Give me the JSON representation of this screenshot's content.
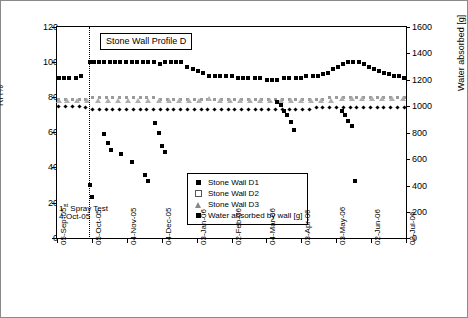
{
  "chart_data": {
    "type": "scatter",
    "title": "Stone Wall Profile D",
    "xlabel": "",
    "ylabel_left": "RH%",
    "ylabel_right": "Water absorbed [g]",
    "ylim_left": [
      0,
      120
    ],
    "ylim_right": [
      0,
      1600
    ],
    "yticks_left": [
      0,
      20,
      40,
      60,
      80,
      100,
      120
    ],
    "yticks_right": [
      0,
      200,
      400,
      600,
      800,
      1000,
      1200,
      1400,
      1600
    ],
    "grid": false,
    "legend_position": "inside-bottom-center",
    "annotations": [
      {
        "text_line1": "1st Spray Test",
        "text_line2": "4-Oct-05"
      }
    ],
    "xticks": [
      "05-Sep-05",
      "05-Oct-05",
      "04-Nov-05",
      "04-Dec-05",
      "03-Jan-06",
      "02-Feb-06",
      "04-Mar-06",
      "03-Apr-06",
      "03-May-06",
      "02-Jun-06",
      "02-Jul-06"
    ],
    "series": [
      {
        "name": "Stone Wall D1",
        "axis": "left",
        "marker": "filled-square",
        "points": [
          [
            0.5,
            91
          ],
          [
            2.0,
            91
          ],
          [
            3.5,
            91
          ],
          [
            5.5,
            91
          ],
          [
            7.0,
            92
          ],
          [
            9.6,
            100
          ],
          [
            11.0,
            100
          ],
          [
            12.5,
            100
          ],
          [
            14.0,
            100
          ],
          [
            15.5,
            100
          ],
          [
            17.0,
            100
          ],
          [
            18.5,
            100
          ],
          [
            20.5,
            100
          ],
          [
            22.0,
            100
          ],
          [
            23.5,
            100
          ],
          [
            25.5,
            100
          ],
          [
            27.0,
            100
          ],
          [
            28.5,
            100
          ],
          [
            30.5,
            99
          ],
          [
            32.0,
            100
          ],
          [
            33.5,
            100
          ],
          [
            35.0,
            100
          ],
          [
            36.5,
            100
          ],
          [
            38.5,
            97
          ],
          [
            40.0,
            96
          ],
          [
            41.5,
            95
          ],
          [
            43.0,
            94
          ],
          [
            45.0,
            92
          ],
          [
            46.5,
            92
          ],
          [
            48.0,
            92
          ],
          [
            50.0,
            92
          ],
          [
            51.5,
            92
          ],
          [
            53.5,
            91
          ],
          [
            55.0,
            91
          ],
          [
            56.5,
            91
          ],
          [
            58.5,
            91
          ],
          [
            60.0,
            91
          ],
          [
            62.0,
            90
          ],
          [
            63.5,
            90
          ],
          [
            65.0,
            90
          ],
          [
            67.0,
            91
          ],
          [
            68.5,
            91
          ],
          [
            70.5,
            91
          ],
          [
            72.0,
            91
          ],
          [
            73.5,
            92
          ],
          [
            75.5,
            92
          ],
          [
            77.0,
            92
          ],
          [
            78.5,
            93
          ],
          [
            80.0,
            94
          ],
          [
            81.5,
            96
          ],
          [
            83.0,
            97
          ],
          [
            84.5,
            99
          ],
          [
            86.0,
            100
          ],
          [
            87.5,
            100
          ],
          [
            89.0,
            100
          ],
          [
            90.5,
            99
          ],
          [
            92.0,
            97
          ],
          [
            93.5,
            96
          ],
          [
            95.0,
            95
          ],
          [
            96.5,
            94
          ],
          [
            98.0,
            93
          ],
          [
            99.5,
            92
          ],
          [
            101.0,
            92
          ],
          [
            102.5,
            91
          ]
        ]
      },
      {
        "name": "Stone Wall D2",
        "axis": "left",
        "marker": "open-square",
        "points": [
          [
            0.5,
            79
          ],
          [
            2.5,
            79
          ],
          [
            4.5,
            79
          ],
          [
            6.5,
            79
          ],
          [
            8.5,
            79
          ],
          [
            10.5,
            80
          ],
          [
            12.5,
            80
          ],
          [
            14.5,
            80
          ],
          [
            16.5,
            80
          ],
          [
            18.5,
            80
          ],
          [
            20.5,
            80
          ],
          [
            22.5,
            80
          ],
          [
            24.5,
            80
          ],
          [
            26.5,
            80
          ],
          [
            28.5,
            80
          ],
          [
            30.5,
            79
          ],
          [
            32.5,
            79
          ],
          [
            34.5,
            79
          ],
          [
            36.5,
            79
          ],
          [
            38.5,
            79
          ],
          [
            40.5,
            79
          ],
          [
            42.5,
            79
          ],
          [
            44.5,
            79
          ],
          [
            46.5,
            79
          ],
          [
            48.5,
            79
          ],
          [
            50.5,
            79
          ],
          [
            52.5,
            79
          ],
          [
            54.5,
            79
          ],
          [
            56.5,
            79
          ],
          [
            58.5,
            79
          ],
          [
            60.5,
            79
          ],
          [
            62.5,
            79
          ],
          [
            64.5,
            79
          ],
          [
            66.5,
            79
          ],
          [
            68.5,
            79
          ],
          [
            70.5,
            79
          ],
          [
            72.5,
            79
          ],
          [
            74.5,
            79
          ],
          [
            76.5,
            79
          ],
          [
            78.5,
            79
          ],
          [
            80.5,
            80
          ],
          [
            82.5,
            80
          ],
          [
            84.5,
            80
          ],
          [
            86.5,
            80
          ],
          [
            88.5,
            80
          ],
          [
            90.5,
            80
          ],
          [
            92.5,
            80
          ],
          [
            94.5,
            80
          ],
          [
            96.5,
            80
          ],
          [
            98.5,
            80
          ],
          [
            100.5,
            80
          ],
          [
            102.5,
            80
          ]
        ]
      },
      {
        "name": "Stone Wall D3",
        "axis": "left",
        "marker": "triangle",
        "points": [
          [
            0.5,
            78
          ],
          [
            3.0,
            78
          ],
          [
            6.0,
            78
          ],
          [
            9.0,
            78
          ],
          [
            12.0,
            78
          ],
          [
            15.0,
            78
          ],
          [
            18.0,
            78
          ],
          [
            21.0,
            78
          ],
          [
            24.0,
            78
          ],
          [
            27.0,
            78
          ],
          [
            30.0,
            78
          ],
          [
            33.0,
            78
          ],
          [
            36.0,
            78
          ],
          [
            39.0,
            78
          ],
          [
            42.0,
            78
          ],
          [
            45.0,
            79
          ],
          [
            48.0,
            78
          ],
          [
            51.0,
            78
          ],
          [
            54.0,
            78
          ],
          [
            57.0,
            78
          ],
          [
            60.0,
            78
          ],
          [
            63.0,
            78
          ],
          [
            66.0,
            78
          ],
          [
            69.0,
            78
          ],
          [
            72.0,
            78
          ],
          [
            75.0,
            78
          ],
          [
            78.0,
            78
          ],
          [
            81.0,
            78
          ],
          [
            84.0,
            79
          ],
          [
            87.0,
            79
          ],
          [
            90.0,
            79
          ],
          [
            93.0,
            79
          ],
          [
            96.0,
            79
          ],
          [
            99.0,
            79
          ],
          [
            102.0,
            79
          ]
        ]
      },
      {
        "name": "Stone Wall D4",
        "axis": "left",
        "marker": "filled-diamond",
        "points": [
          [
            0.5,
            75
          ],
          [
            2.5,
            75
          ],
          [
            4.5,
            75
          ],
          [
            6.5,
            75
          ],
          [
            8.5,
            74
          ],
          [
            10.5,
            73
          ],
          [
            12.5,
            73
          ],
          [
            14.5,
            73
          ],
          [
            16.5,
            73
          ],
          [
            18.5,
            73
          ],
          [
            20.5,
            73
          ],
          [
            22.5,
            73
          ],
          [
            24.5,
            73
          ],
          [
            26.5,
            73
          ],
          [
            28.5,
            73
          ],
          [
            30.5,
            73
          ],
          [
            32.5,
            73
          ],
          [
            34.5,
            73
          ],
          [
            36.5,
            73
          ],
          [
            38.5,
            73
          ],
          [
            40.5,
            73
          ],
          [
            42.5,
            73
          ],
          [
            44.5,
            73
          ],
          [
            46.5,
            73
          ],
          [
            48.5,
            73
          ],
          [
            50.5,
            73
          ],
          [
            52.5,
            73
          ],
          [
            54.5,
            73
          ],
          [
            56.5,
            73
          ],
          [
            58.5,
            73
          ],
          [
            60.5,
            73
          ],
          [
            62.5,
            73
          ],
          [
            64.5,
            73
          ],
          [
            66.5,
            73
          ],
          [
            68.5,
            73
          ],
          [
            70.5,
            73
          ],
          [
            72.5,
            73
          ],
          [
            74.5,
            73
          ],
          [
            76.5,
            74
          ],
          [
            78.5,
            74
          ],
          [
            80.5,
            74
          ],
          [
            82.5,
            74
          ],
          [
            84.5,
            74
          ],
          [
            86.5,
            74
          ],
          [
            88.5,
            74
          ],
          [
            90.5,
            74
          ],
          [
            92.5,
            74
          ],
          [
            94.5,
            74
          ],
          [
            96.5,
            74
          ],
          [
            98.5,
            74
          ],
          [
            100.5,
            74
          ],
          [
            102.5,
            74
          ]
        ]
      },
      {
        "name": "Water absorbed by wall [g]",
        "axis": "right",
        "marker": "filled-square",
        "values_g": [
          [
            9.6,
            400
          ],
          [
            10.4,
            310
          ],
          [
            14.0,
            790
          ],
          [
            15.0,
            720
          ],
          [
            16.0,
            665
          ],
          [
            19.0,
            640
          ],
          [
            22.0,
            580
          ],
          [
            26.0,
            480
          ],
          [
            27.0,
            430
          ],
          [
            29.0,
            870
          ],
          [
            30.0,
            800
          ],
          [
            31.0,
            700
          ],
          [
            32.0,
            650
          ],
          [
            65.0,
            1030
          ],
          [
            66.0,
            1010
          ],
          [
            67.0,
            960
          ],
          [
            68.0,
            930
          ],
          [
            69.0,
            880
          ],
          [
            70.0,
            820
          ],
          [
            71.0,
            430
          ],
          [
            72.0,
            420
          ],
          [
            84.0,
            960
          ],
          [
            85.0,
            930
          ],
          [
            86.0,
            890
          ],
          [
            87.0,
            850
          ],
          [
            88.0,
            430
          ]
        ]
      }
    ]
  },
  "legend": {
    "items": [
      {
        "label": "Stone Wall D1",
        "marker": "filled-square"
      },
      {
        "label": "Stone Wall D2",
        "marker": "open-square"
      },
      {
        "label": "Stone Wall D3",
        "marker": "triangle"
      },
      {
        "label": "Water absorbed by wall [g]",
        "marker": "filled-square"
      }
    ]
  },
  "annotation": {
    "line1_prefix": "1",
    "line1_sup": "st",
    "line1_rest": " Spray Test",
    "line2": "4-Oct-05"
  },
  "axes": {
    "title": "Stone Wall Profile D",
    "left_label": "RH%",
    "right_label": "Water absorbed [g]",
    "left_ticks": [
      "120",
      "100",
      "80",
      "60",
      "40",
      "20",
      "0"
    ],
    "right_ticks": [
      "1600",
      "1400",
      "1200",
      "1000",
      "800",
      "600",
      "400",
      "200",
      "0"
    ],
    "x_ticks": [
      "05-Sep-05",
      "05-Oct-05",
      "04-Nov-05",
      "04-Dec-05",
      "03-Jan-06",
      "02-Feb-06",
      "04-Mar-06",
      "03-Apr-06",
      "03-May-06",
      "02-Jun-06",
      "02-Jul-06"
    ]
  }
}
